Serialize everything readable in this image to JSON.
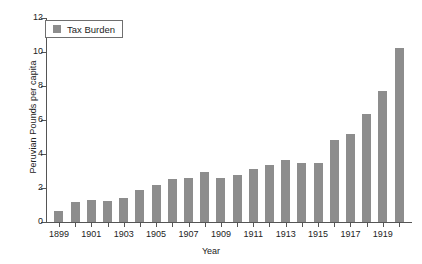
{
  "chart_data": {
    "type": "bar",
    "title": "",
    "xlabel": "Year",
    "ylabel": "Peruvian Pounds per capita",
    "ylim": [
      0,
      12
    ],
    "yticks": [
      0,
      2,
      4,
      6,
      8,
      10,
      12
    ],
    "grid": false,
    "legend": {
      "position": "top-left",
      "entries": [
        "Tax Burden"
      ]
    },
    "series": [
      {
        "name": "Tax Burden",
        "color": "#8d8d8d",
        "values": [
          0.65,
          1.15,
          1.3,
          1.25,
          1.4,
          1.9,
          2.15,
          2.55,
          2.6,
          2.95,
          2.6,
          2.75,
          3.1,
          3.35,
          3.65,
          3.5,
          3.5,
          4.85,
          5.2,
          6.35,
          7.7,
          10.25
        ]
      }
    ],
    "categories": [
      "1899",
      "1900",
      "1901",
      "1902",
      "1903",
      "1904",
      "1905",
      "1906",
      "1907",
      "1908",
      "1909",
      "1910",
      "1911",
      "1912",
      "1913",
      "1914",
      "1915",
      "1916",
      "1917",
      "1918",
      "1919",
      "1920"
    ],
    "xtick_labels": [
      "1899",
      "1901",
      "1903",
      "1905",
      "1907",
      "1909",
      "1911",
      "1913",
      "1915",
      "1917",
      "1919"
    ]
  }
}
